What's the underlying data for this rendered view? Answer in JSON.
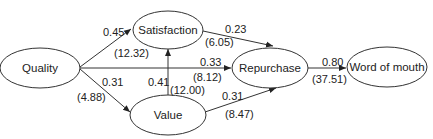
{
  "diagram": {
    "type": "path-model",
    "nodes": {
      "quality": "Quality",
      "satisfaction": "Satisfaction",
      "value": "Value",
      "repurchase": "Repurchase",
      "word_of_mouth": "Word of mouth"
    },
    "edges": {
      "quality_satisfaction": {
        "from": "Quality",
        "to": "Satisfaction",
        "coef": "0.45",
        "t": "(12.32)"
      },
      "quality_repurchase": {
        "from": "Quality",
        "to": "Repurchase",
        "coef": "0.33",
        "t": "(8.12)"
      },
      "quality_value": {
        "from": "Quality",
        "to": "Value",
        "coef": "0.31",
        "t": "(4.88)"
      },
      "value_satisfaction": {
        "from": "Value",
        "to": "Satisfaction",
        "coef": "0.41",
        "t": "(12.00)"
      },
      "satisfaction_repurchase": {
        "from": "Satisfaction",
        "to": "Repurchase",
        "coef": "0.23",
        "t": "(6.05)"
      },
      "value_repurchase": {
        "from": "Value",
        "to": "Repurchase",
        "coef": "0.31",
        "t": "(8.47)"
      },
      "repurchase_wom": {
        "from": "Repurchase",
        "to": "Word of mouth",
        "coef": "0.80",
        "t": "(37.51)"
      }
    }
  }
}
